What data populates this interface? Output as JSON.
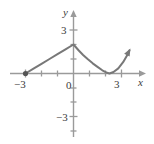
{
  "figure": {
    "background_color": "#ffffff",
    "axis_color": "#9a9a9a",
    "curve_color": "#787878",
    "label_color": "#3b3b3b"
  },
  "chart_data": {
    "type": "line",
    "title": "",
    "subtitle": "",
    "xlabel": "x",
    "ylabel": "y",
    "xlim": [
      -3.7,
      3.9
    ],
    "ylim": [
      -4.5,
      3.6
    ],
    "grid": false,
    "legend": null,
    "x_ticks": [
      -3,
      0,
      3
    ],
    "x_tick_labels": [
      "−3",
      "0",
      "3"
    ],
    "x_minor_ticks": [
      -2,
      -1,
      1,
      2
    ],
    "y_ticks": [
      3,
      -3
    ],
    "y_tick_labels": [
      "3",
      "−3"
    ],
    "y_minor_ticks": [
      2,
      1,
      -1,
      -2,
      -4
    ],
    "axis_arrows": [
      "x-positive",
      "y-positive"
    ],
    "annotations": [
      {
        "name": "closed-endpoint",
        "x": -3,
        "y": 0,
        "marker": "filled-circle"
      },
      {
        "name": "curve-arrowhead",
        "x": 3.5,
        "y": 1.6,
        "marker": "arrowhead"
      }
    ],
    "series": [
      {
        "name": "piecewise-curve",
        "style": "solid",
        "color": "#787878",
        "points": [
          {
            "x": -3.0,
            "y": 0.0
          },
          {
            "x": -2.5,
            "y": 0.33
          },
          {
            "x": -2.0,
            "y": 0.67
          },
          {
            "x": -1.5,
            "y": 1.0
          },
          {
            "x": -1.0,
            "y": 1.33
          },
          {
            "x": -0.5,
            "y": 1.67
          },
          {
            "x": 0.0,
            "y": 2.0
          },
          {
            "x": 0.3,
            "y": 1.62
          },
          {
            "x": 0.6,
            "y": 1.28
          },
          {
            "x": 0.9,
            "y": 0.98
          },
          {
            "x": 1.2,
            "y": 0.7
          },
          {
            "x": 1.5,
            "y": 0.46
          },
          {
            "x": 1.8,
            "y": 0.22
          },
          {
            "x": 2.1,
            "y": 0.05
          },
          {
            "x": 2.25,
            "y": 0.0
          },
          {
            "x": 2.5,
            "y": 0.1
          },
          {
            "x": 2.8,
            "y": 0.35
          },
          {
            "x": 3.1,
            "y": 0.78
          },
          {
            "x": 3.4,
            "y": 1.35
          },
          {
            "x": 3.5,
            "y": 1.6
          }
        ]
      }
    ]
  }
}
